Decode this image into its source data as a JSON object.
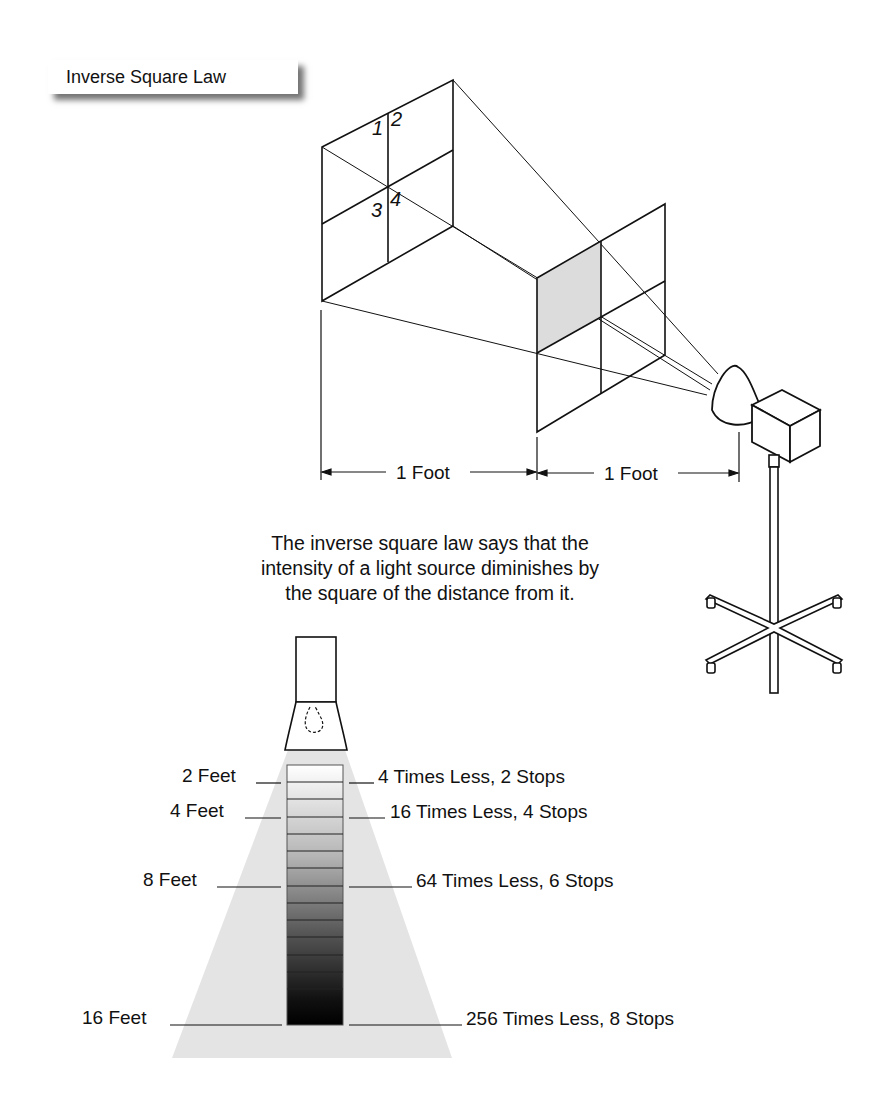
{
  "title": "Inverse Square Law",
  "top_diagram": {
    "quadrant_numbers": [
      "1",
      "2",
      "3",
      "4"
    ],
    "dimension_labels": [
      "1 Foot",
      "1 Foot"
    ]
  },
  "caption": {
    "lines": [
      "The inverse square law says that the",
      "intensity of a light source diminishes by",
      "the square of the distance from it."
    ]
  },
  "bottom_diagram": {
    "distance_labels": [
      "2 Feet",
      "4 Feet",
      "8 Feet",
      "16 Feet"
    ],
    "falloff_labels": [
      "4 Times Less, 2 Stops",
      "16 Times Less, 4 Stops",
      "64 Times Less, 6 Stops",
      "256 Times Less, 8 Stops"
    ],
    "band_count": 15
  },
  "colors": {
    "line": "#111111",
    "shaded_quadrant": "#dcdcdc",
    "light_cone": "#e4e4e4",
    "gradient_top": "#ffffff",
    "gradient_bottom": "#000000"
  }
}
